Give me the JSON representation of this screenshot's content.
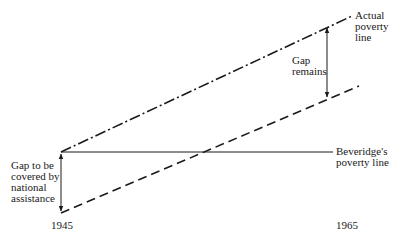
{
  "diagram": {
    "lines": {
      "actual_poverty_line": {
        "label": [
          "Actual",
          "poverty",
          "line"
        ],
        "style": "dash-dot"
      },
      "beveridge_poverty_line": {
        "label": [
          "Beveridge's",
          "poverty line"
        ],
        "style": "solid"
      },
      "assistance_line": {
        "style": "dashed"
      }
    },
    "annotations": {
      "gap_start": [
        "Gap to be",
        "covered by",
        "national",
        "assistance"
      ],
      "gap_end": [
        "Gap",
        "remains"
      ]
    },
    "x_labels": {
      "start": "1945",
      "end": "1965"
    },
    "colors": {
      "ink": "#1a1a1a",
      "background": "#ffffff"
    }
  }
}
